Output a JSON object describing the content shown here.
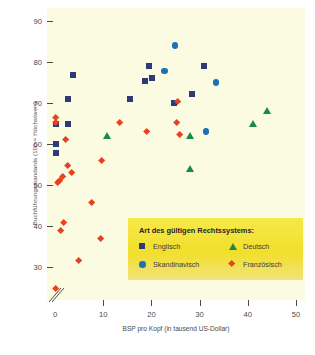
{
  "chart_data": {
    "type": "scatter",
    "title": "",
    "xlabel": "BSP pro Kopf (in tausend US-Dollar)",
    "ylabel": "Buchführungsstandards (100 = Höchstwert)",
    "xlim": [
      0,
      50
    ],
    "ylim": [
      22,
      92
    ],
    "xticks": [
      0,
      10,
      20,
      30,
      40,
      50
    ],
    "yticks": [
      30,
      40,
      50,
      60,
      70,
      80,
      90
    ],
    "grid": false,
    "axis_break_x": true,
    "legend_position": "inside-bottom-right",
    "series": [
      {
        "name": "Englisch",
        "marker": "square",
        "color": "#2b3a78",
        "points": [
          [
            0.2,
            65.0
          ],
          [
            0.2,
            60.0
          ],
          [
            0.2,
            57.8
          ],
          [
            2.6,
            65.0
          ],
          [
            2.6,
            71.0
          ],
          [
            3.7,
            76.8
          ],
          [
            15.5,
            71.0
          ],
          [
            18.6,
            75.3
          ],
          [
            19.5,
            79.0
          ],
          [
            20.2,
            76.0
          ],
          [
            24.6,
            70.0
          ],
          [
            28.4,
            72.2
          ],
          [
            30.9,
            79.0
          ]
        ]
      },
      {
        "name": "Skandinavisch",
        "marker": "circle",
        "color": "#1f6fb5",
        "points": [
          [
            24.9,
            84.0
          ],
          [
            22.7,
            77.8
          ],
          [
            33.4,
            75.0
          ],
          [
            31.3,
            63.0
          ]
        ]
      },
      {
        "name": "Deutsch",
        "marker": "triangle",
        "color": "#1a8a47",
        "points": [
          [
            10.8,
            62.0
          ],
          [
            28.1,
            62.0
          ],
          [
            28.0,
            54.0
          ],
          [
            41.0,
            65.0
          ],
          [
            44.0,
            68.2
          ]
        ]
      },
      {
        "name": "Französisch",
        "marker": "diamond",
        "color": "#e8411f",
        "points": [
          [
            0.2,
            66.3
          ],
          [
            0.2,
            65.2
          ],
          [
            0.2,
            24.8
          ],
          [
            0.5,
            50.6
          ],
          [
            0.9,
            51.0
          ],
          [
            1.1,
            38.9
          ],
          [
            1.5,
            52.0
          ],
          [
            1.9,
            40.8
          ],
          [
            2.2,
            61.0
          ],
          [
            2.7,
            54.7
          ],
          [
            3.4,
            53.0
          ],
          [
            4.9,
            31.6
          ],
          [
            7.6,
            45.6
          ],
          [
            9.5,
            36.9
          ],
          [
            9.7,
            56.0
          ],
          [
            13.5,
            65.3
          ],
          [
            19.0,
            63.0
          ],
          [
            25.3,
            65.2
          ],
          [
            25.5,
            70.4
          ],
          [
            25.8,
            62.3
          ]
        ]
      }
    ]
  },
  "axes": {
    "y_title": "Buchführungsstandards (100 = Höchstwert)",
    "x_title": "BSP pro Kopf (in tausend US-Dollar)",
    "y_ticks": [
      "90",
      "80",
      "70",
      "60",
      "50",
      "40",
      "30"
    ],
    "x_ticks": [
      "0",
      "10",
      "20",
      "30",
      "40",
      "50"
    ]
  },
  "legend": {
    "title": "Art des gültigen Rechtssystems:",
    "entries": [
      {
        "label": "Englisch",
        "marker": "square",
        "color": "#2b3a78"
      },
      {
        "label": "Deutsch",
        "marker": "triangle",
        "color": "#1a8a47"
      },
      {
        "label": "Skandinavisch",
        "marker": "circle",
        "color": "#1f6fb5"
      },
      {
        "label": "Französisch",
        "marker": "diamond",
        "color": "#e8411f"
      }
    ]
  },
  "colors": {
    "plot_background": "#fbfbe2",
    "legend_background": "#f2e02c",
    "axis": "#4a4a4a",
    "page_background": "#ffffff"
  }
}
